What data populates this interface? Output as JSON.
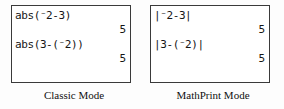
{
  "figure": {
    "background_color": "#fdfdfd",
    "screen_border_color": "#3a3a3a",
    "text_color": "#151515"
  },
  "panels": [
    {
      "id": "classic",
      "caption": "Classic Mode",
      "screen": {
        "entries": [
          {
            "expression": "abs(⁻2-3)",
            "result": "5"
          },
          {
            "expression": "abs(3-(⁻2))",
            "result": "5"
          }
        ]
      }
    },
    {
      "id": "mathprint",
      "caption": "MathPrint Mode",
      "screen": {
        "entries": [
          {
            "expression": "|⁻2-3|",
            "result": "5"
          },
          {
            "expression": "|3-(⁻2)|",
            "result": "5"
          }
        ]
      }
    }
  ]
}
